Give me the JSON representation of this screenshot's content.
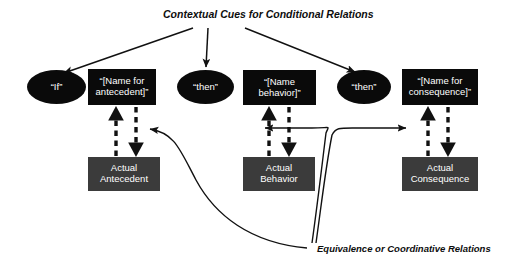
{
  "diagram": {
    "title": "Contextual Cues for Conditional Relations",
    "relation_label": "Equivalence or Coordinative Relations",
    "colors": {
      "cue_fill": "#0a0a0a",
      "actual_fill": "#3b3b3b",
      "stroke": "#111111",
      "text": "#ffffff",
      "background": "#ffffff"
    },
    "cue_nodes": [
      {
        "id": "if",
        "shape": "oval",
        "label": "“If”"
      },
      {
        "id": "name-antecedent",
        "shape": "rect",
        "label": "“[Name for antecedent]”"
      },
      {
        "id": "then-1",
        "shape": "oval",
        "label": "“then”"
      },
      {
        "id": "name-behavior",
        "shape": "rect",
        "label": "“[Name behavior]”"
      },
      {
        "id": "then-2",
        "shape": "oval",
        "label": "“then”"
      },
      {
        "id": "name-consequence",
        "shape": "rect",
        "label": "“[Name for consequence]”"
      }
    ],
    "actual_nodes": [
      {
        "id": "actual-antecedent",
        "label": "Actual Antecedent"
      },
      {
        "id": "actual-behavior",
        "label": "Actual Behavior"
      },
      {
        "id": "actual-consequence",
        "label": "Actual Consequence"
      }
    ]
  }
}
